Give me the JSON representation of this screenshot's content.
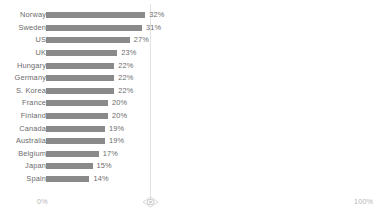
{
  "chart_data": {
    "type": "bar",
    "orientation": "horizontal",
    "title": "",
    "subtitle": "",
    "xlabel": "",
    "ylabel": "",
    "xlim": [
      0,
      100
    ],
    "grid": false,
    "legend": null,
    "axis_tick_labels": [
      "0%",
      "100%"
    ],
    "value_suffix": "%",
    "categories": [
      "Norway",
      "Sweden",
      "US",
      "UK",
      "Hungary",
      "Germany",
      "S. Korea",
      "France",
      "Finland",
      "Canada",
      "Australia",
      "Belgium",
      "Japan",
      "Spain"
    ],
    "values": [
      32,
      31,
      27,
      23,
      22,
      22,
      22,
      20,
      20,
      19,
      19,
      17,
      15,
      14
    ],
    "value_labels": [
      "32%",
      "31%",
      "27%",
      "23%",
      "22%",
      "22%",
      "22%",
      "20%",
      "20%",
      "19%",
      "19%",
      "17%",
      "15%",
      "14%"
    ],
    "bar_color": "#8a8a8a",
    "label_color": "#6b6b6b",
    "axis_label_color": "#b6b6b6",
    "background_color": "#ffffff"
  },
  "axis": {
    "min_label": "0%",
    "max_label": "100%"
  },
  "marker": {
    "name": "diamond-handle",
    "position_percent": 33.5
  }
}
